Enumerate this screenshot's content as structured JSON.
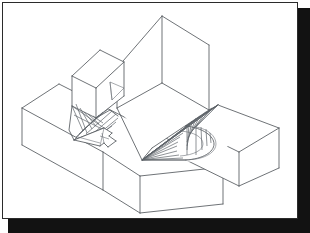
{
  "figure": {
    "kind": "technical-line-drawing",
    "background_color": "#ffffff",
    "line_color": "#555a5f",
    "strong_line_color": "#3c4146",
    "border_color": "#2b2b2b",
    "shadow_color": "#121212",
    "projection": "isometric",
    "caption": ""
  },
  "geometry": {
    "units": "pixels",
    "viewport": {
      "width": 310,
      "height": 233
    },
    "solids": [
      {
        "name": "long-horizontal-bar",
        "type": "rectangular-prism",
        "description": "Long bar running lower-left to lower-right across the scene",
        "outline": "22,108 59,84 223,167 223,204 140,213 103,190 22,145",
        "edges": [
          "22,108 59,84",
          "59,84 223,167",
          "22,108 22,145",
          "22,145 103,190",
          "103,190 140,213",
          "140,213 223,204"
        ]
      },
      {
        "name": "small-upper-left-box",
        "type": "rectangular-prism",
        "description": "Small cube sitting above the long bar on the left",
        "outline": "72,76 100,50 124,62 124,96 96,118 72,106"
      },
      {
        "name": "tall-vertical-slab",
        "type": "prism-with-slanted-faces",
        "description": "Tall upright slab in the centre-right with chamfered faces",
        "outline": "162,16 209,45 209,110 152,148 117,128 117,68"
      },
      {
        "name": "right-rectangular-block",
        "type": "rectangular-prism",
        "description": "Block at right side of the scene",
        "outline": "218,105 279,128 279,168 239,186 186,160 186,126"
      }
    ],
    "blend_surfaces": [
      {
        "name": "left-twisted-ruled-surface",
        "type": "ruled-twisted",
        "description": "Hyperbolic / twisted ruled blend between the small box and the arrow-shaped slot",
        "rule_count": 10,
        "apex_region": "96,100"
      },
      {
        "name": "right-conical-fan-surface",
        "type": "ruled-conical-fan",
        "description": "Fan of straight rulings converging to a point, bounded by a curved edge",
        "rule_count": 18,
        "apex": "142,160"
      }
    ],
    "annotations": [
      {
        "name": "arrow-slot-marker",
        "type": "arrow",
        "description": "Small arrow-shaped planar slot on the bar top face"
      }
    ]
  }
}
